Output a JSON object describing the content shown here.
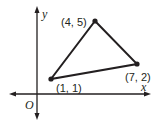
{
  "diagram": {
    "type": "coordinate-plane-triangle",
    "axes": {
      "x_label": "x",
      "y_label": "y",
      "origin_label": "O"
    },
    "vertices": [
      {
        "label": "(4, 5)",
        "x": 4,
        "y": 5
      },
      {
        "label": "(7, 2)",
        "x": 7,
        "y": 2
      },
      {
        "label": "(1, 1)",
        "x": 1,
        "y": 1
      }
    ],
    "colors": {
      "stroke": "#231f20",
      "background": "#ffffff"
    }
  }
}
